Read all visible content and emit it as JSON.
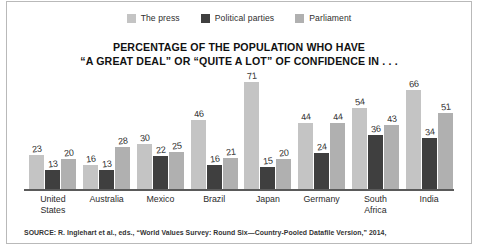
{
  "legend": {
    "items": [
      {
        "label": "The press",
        "color": "#c4c4c4",
        "swatch_name": "legend-swatch-press"
      },
      {
        "label": "Political parties",
        "color": "#3f3f3f",
        "swatch_name": "legend-swatch-political-parties"
      },
      {
        "label": "Parliament",
        "color": "#b0b0b0",
        "swatch_name": "legend-swatch-parliament"
      }
    ]
  },
  "title": {
    "line1": "PERCENTAGE OF THE POPULATION WHO HAVE",
    "line2": "“A GREAT DEAL” OR “QUITE A LOT” OF CONFIDENCE IN . . ."
  },
  "source": {
    "text": "SOURCE: R. Inglehart et al., eds., “World Values Survey: Round Six—Country-Pooled Datafile Version,” 2014,"
  },
  "categories_display": [
    {
      "line1": "United",
      "line2": "States"
    },
    {
      "line1": "Australia",
      "line2": ""
    },
    {
      "line1": "Mexico",
      "line2": ""
    },
    {
      "line1": "Brazil",
      "line2": ""
    },
    {
      "line1": "Japan",
      "line2": ""
    },
    {
      "line1": "Germany",
      "line2": ""
    },
    {
      "line1": "South",
      "line2": "Africa"
    },
    {
      "line1": "India",
      "line2": ""
    }
  ],
  "chart_data": {
    "type": "bar",
    "title": "PERCENTAGE OF THE POPULATION WHO HAVE “A GREAT DEAL” OR “QUITE A LOT” OF CONFIDENCE IN . . .",
    "xlabel": "",
    "ylabel": "",
    "ylim": [
      0,
      75
    ],
    "grid": false,
    "legend_position": "top-center",
    "value_labels": true,
    "value_label_rotation_deg": -7,
    "categories": [
      "United States",
      "Australia",
      "Mexico",
      "Brazil",
      "Japan",
      "Germany",
      "South Africa",
      "India"
    ],
    "series": [
      {
        "name": "The press",
        "color": "#c4c4c4",
        "values": [
          23,
          16,
          30,
          46,
          71,
          44,
          54,
          66
        ]
      },
      {
        "name": "Political parties",
        "color": "#3f3f3f",
        "values": [
          13,
          13,
          22,
          16,
          15,
          24,
          36,
          34
        ]
      },
      {
        "name": "Parliament",
        "color": "#b0b0b0",
        "values": [
          20,
          28,
          25,
          21,
          20,
          44,
          43,
          51
        ]
      }
    ]
  }
}
